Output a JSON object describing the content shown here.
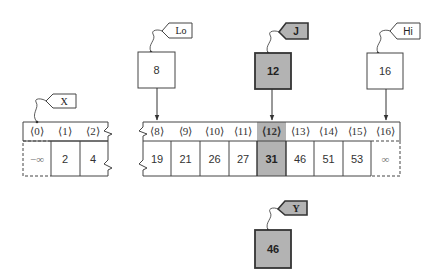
{
  "diagram": {
    "colors": {
      "highlight": "#b3b3b3",
      "stroke": "#444444",
      "background": "#ffffff"
    },
    "variables": [
      {
        "name": "Lo",
        "value": "8",
        "highlighted": false
      },
      {
        "name": "J",
        "value": "12",
        "highlighted": true
      },
      {
        "name": "Hi",
        "value": "16",
        "highlighted": false
      },
      {
        "name": "Y",
        "value": "46",
        "highlighted": true
      }
    ],
    "array_name": "X",
    "left_segment": {
      "indices": [
        "⟨0⟩",
        "⟨1⟩",
        "⟨2⟩"
      ],
      "values": [
        "−∞",
        "2",
        "4"
      ],
      "sentinel_index": 0
    },
    "main_segment": {
      "indices": [
        "⟨8⟩",
        "⟨9⟩",
        "⟨10⟩",
        "⟨11⟩",
        "⟨12⟩",
        "⟨13⟩",
        "⟨14⟩",
        "⟨15⟩",
        "⟨16⟩"
      ],
      "values": [
        "19",
        "21",
        "26",
        "27",
        "31",
        "46",
        "51",
        "53",
        "∞"
      ],
      "highlight_index": 4,
      "sentinel_index": 8
    }
  }
}
